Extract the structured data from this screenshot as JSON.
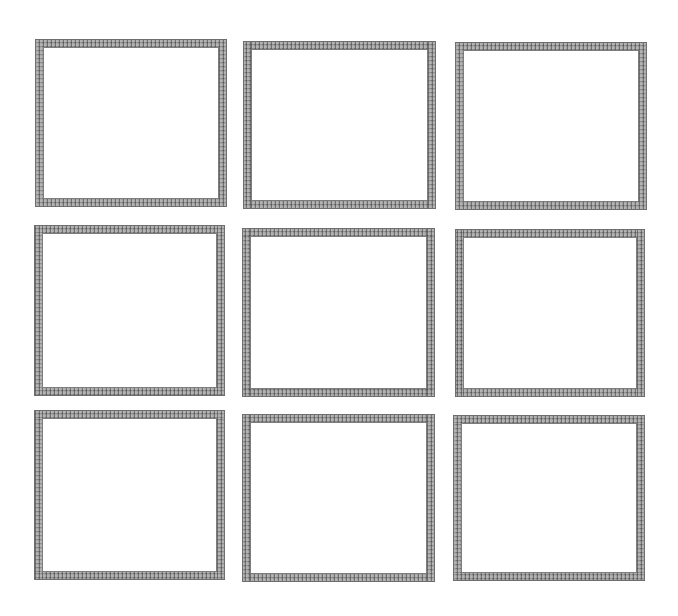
{
  "page": {
    "background": "#ffffff",
    "frame_color": "#9a9a9a",
    "grid": {
      "rows": 3,
      "columns": 3
    }
  },
  "frames": [
    {
      "row": 1,
      "col": 1,
      "left": 35,
      "top": 39,
      "width": 192,
      "height": 168
    },
    {
      "row": 1,
      "col": 2,
      "left": 243,
      "top": 41,
      "width": 193,
      "height": 168
    },
    {
      "row": 1,
      "col": 3,
      "left": 455,
      "top": 42,
      "width": 192,
      "height": 168
    },
    {
      "row": 2,
      "col": 1,
      "left": 34,
      "top": 225,
      "width": 191,
      "height": 171
    },
    {
      "row": 2,
      "col": 2,
      "left": 242,
      "top": 228,
      "width": 193,
      "height": 169
    },
    {
      "row": 2,
      "col": 3,
      "left": 455,
      "top": 229,
      "width": 190,
      "height": 168
    },
    {
      "row": 3,
      "col": 1,
      "left": 34,
      "top": 410,
      "width": 191,
      "height": 170
    },
    {
      "row": 3,
      "col": 2,
      "left": 242,
      "top": 414,
      "width": 193,
      "height": 168
    },
    {
      "row": 3,
      "col": 3,
      "left": 453,
      "top": 415,
      "width": 192,
      "height": 166
    }
  ]
}
